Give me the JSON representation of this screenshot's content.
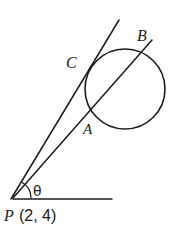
{
  "figure": {
    "type": "geometry-diagram",
    "background_color": "#ffffff",
    "stroke_color": "#1c1c1c",
    "canvas": {
      "width": 174,
      "height": 225
    }
  },
  "labels": {
    "point_a": "A",
    "point_b": "B",
    "point_c": "C",
    "vertex_p": "P",
    "vertex_p_coords": "(2, 4)",
    "angle_theta": "θ"
  },
  "geometry": {
    "circle": {
      "name": "main-circle",
      "center_x": 125,
      "center_y": 89,
      "radius": 40,
      "stroke_width": 1.6
    },
    "vertex_p": {
      "x": 13,
      "y": 198
    },
    "secant_line": {
      "name": "secant-pb",
      "x1": 13,
      "y1": 198,
      "x2": 152,
      "y2": 40,
      "stroke_width": 1.5
    },
    "tangent_line": {
      "name": "tangent-pc",
      "x1": 11,
      "y1": 199,
      "x2": 119,
      "y2": 20,
      "stroke_width": 1.5
    },
    "horizontal_ray": {
      "name": "horizontal-ray",
      "x1": 13,
      "y1": 199,
      "x2": 112,
      "y2": 199,
      "stroke_width": 1.5
    },
    "angle_arc": {
      "name": "angle-arc-theta",
      "radius": 18,
      "stroke_width": 1.2
    },
    "points": {
      "a": {
        "x": 88,
        "y": 122
      },
      "b": {
        "x": 141,
        "y": 48
      },
      "c": {
        "x": 86,
        "y": 68
      }
    }
  },
  "label_positions": {
    "a": {
      "x": 83,
      "y": 134,
      "size": 15
    },
    "b": {
      "x": 137,
      "y": 41,
      "size": 16
    },
    "c": {
      "x": 66,
      "y": 68,
      "size": 16
    },
    "p": {
      "x": 4,
      "y": 221,
      "size": 16
    },
    "p_coords": {
      "x": 19,
      "y": 221,
      "size": 16
    },
    "theta": {
      "x": 33,
      "y": 196,
      "size": 14
    }
  }
}
